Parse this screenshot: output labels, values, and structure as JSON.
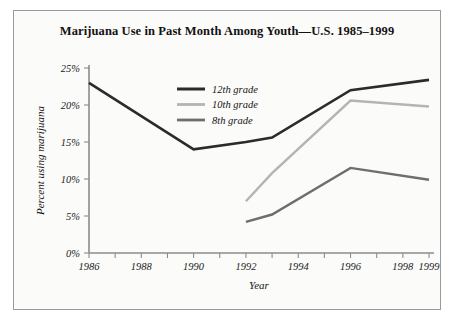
{
  "chart_data": {
    "type": "line",
    "title": "Marijuana Use in Past Month Among Youth—U.S. 1985–1999",
    "xlabel": "Year",
    "ylabel": "Percent using marijuana",
    "x": [
      1986,
      1987,
      1988,
      1989,
      1990,
      1991,
      1992,
      1993,
      1994,
      1995,
      1996,
      1997,
      1998,
      1999
    ],
    "xlim": [
      1986,
      1999
    ],
    "ylim": [
      0,
      25
    ],
    "ytick_labels": [
      "0%",
      "5%",
      "10%",
      "15%",
      "20%",
      "25%"
    ],
    "ytick_values": [
      0,
      5,
      10,
      15,
      20,
      25
    ],
    "xtick_labels": [
      "1986",
      "1988",
      "1990",
      "1992",
      "1994",
      "1996",
      "1998",
      "1999"
    ],
    "xtick_values": [
      1986,
      1988,
      1990,
      1992,
      1994,
      1996,
      1998,
      1999
    ],
    "grid": false,
    "legend_position": "upper center",
    "series": [
      {
        "name": "12th grade",
        "color": "#2b2b2b",
        "x": [
          1986,
          1990,
          1992,
          1993,
          1996,
          1999
        ],
        "values": [
          23.0,
          14.0,
          15.0,
          15.6,
          22.0,
          23.4
        ]
      },
      {
        "name": "10th grade",
        "color": "#b4b4b4",
        "x": [
          1992,
          1993,
          1996,
          1999
        ],
        "values": [
          7.0,
          10.8,
          20.6,
          19.8
        ]
      },
      {
        "name": "8th grade",
        "color": "#6e6e6e",
        "x": [
          1992,
          1993,
          1996,
          1999
        ],
        "values": [
          4.2,
          5.2,
          11.5,
          9.9
        ]
      }
    ]
  },
  "legend": {
    "items": [
      {
        "label": "12th grade"
      },
      {
        "label": "10th grade"
      },
      {
        "label": "8th grade"
      }
    ]
  }
}
